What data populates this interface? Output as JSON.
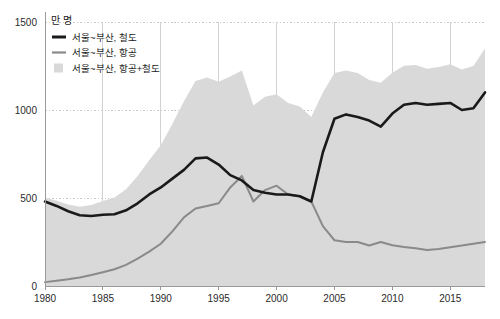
{
  "axes": {
    "y_unit_label": "만 명",
    "y_ticks": [
      "0",
      "500",
      "1000",
      "1500"
    ],
    "x_ticks": [
      "1980",
      "1985",
      "1990",
      "1995",
      "2000",
      "2005",
      "2010",
      "2015"
    ]
  },
  "legend": {
    "items": [
      {
        "label": "서울~부산, 철도",
        "marker": "line",
        "color": "#1a1a1a"
      },
      {
        "label": "서울~부산, 항공",
        "marker": "line",
        "color": "#8a8a8a"
      },
      {
        "label": "서울~부산, 항공+철도",
        "marker": "swatch",
        "color": "#d9d9d9"
      }
    ]
  },
  "colors": {
    "rail_line": "#1a1a1a",
    "air_line": "#8a8a8a",
    "area_fill": "#d9d9d9",
    "gridline": "#c8c8c8",
    "axis": "#9a9a9a",
    "background": "#ffffff"
  },
  "chart_data": {
    "type": "line",
    "title": "",
    "subtitle": "",
    "xlabel": "",
    "ylabel": "만 명",
    "xlim": [
      1980,
      2018
    ],
    "ylim": [
      0,
      1500
    ],
    "grid": true,
    "legend_position": "top-left",
    "x": [
      1980,
      1981,
      1982,
      1983,
      1984,
      1985,
      1986,
      1987,
      1988,
      1989,
      1990,
      1991,
      1992,
      1993,
      1994,
      1995,
      1996,
      1997,
      1998,
      1999,
      2000,
      2001,
      2002,
      2003,
      2004,
      2005,
      2006,
      2007,
      2008,
      2009,
      2010,
      2011,
      2012,
      2013,
      2014,
      2015,
      2016,
      2017,
      2018
    ],
    "series": [
      {
        "name": "서울~부산, 철도",
        "type": "line",
        "color": "#1a1a1a",
        "values": [
          480,
          455,
          425,
          402,
          398,
          405,
          408,
          430,
          470,
          520,
          560,
          610,
          660,
          725,
          730,
          690,
          630,
          600,
          545,
          530,
          520,
          520,
          510,
          480,
          760,
          950,
          975,
          960,
          940,
          905,
          980,
          1030,
          1040,
          1030,
          1035,
          1040,
          1000,
          1010,
          1100
        ]
      },
      {
        "name": "서울~부산, 항공",
        "type": "line",
        "color": "#8a8a8a",
        "values": [
          22,
          30,
          38,
          48,
          62,
          78,
          95,
          120,
          155,
          195,
          240,
          310,
          390,
          440,
          455,
          470,
          560,
          625,
          480,
          545,
          570,
          520,
          510,
          480,
          340,
          260,
          250,
          250,
          230,
          250,
          232,
          222,
          215,
          205,
          210,
          220,
          230,
          240,
          250
        ]
      },
      {
        "name": "서울~부산, 항공+철도",
        "type": "area",
        "color": "#d9d9d9",
        "values": [
          502,
          485,
          463,
          450,
          460,
          483,
          503,
          550,
          625,
          715,
          800,
          920,
          1050,
          1165,
          1185,
          1160,
          1190,
          1225,
          1025,
          1075,
          1090,
          1040,
          1020,
          960,
          1100,
          1210,
          1225,
          1210,
          1170,
          1155,
          1212,
          1252,
          1255,
          1235,
          1245,
          1260,
          1230,
          1250,
          1350
        ]
      }
    ]
  }
}
